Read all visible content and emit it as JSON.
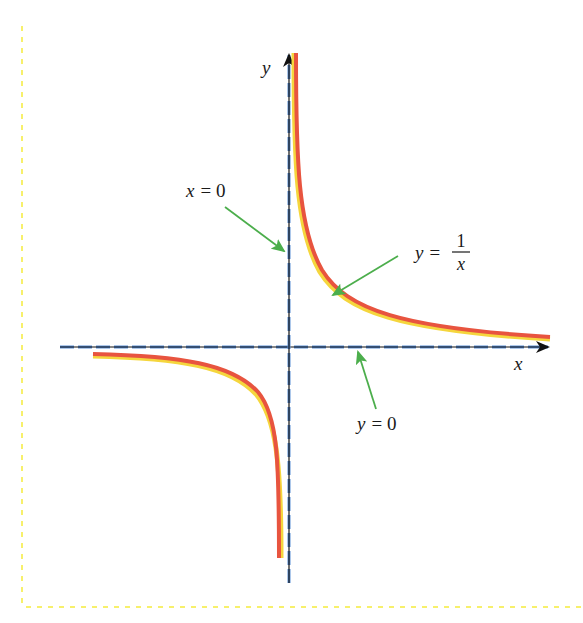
{
  "diagram": {
    "axes": {
      "x_label": "x",
      "y_label": "y"
    },
    "curve": {
      "label_lhs": "y =",
      "label_numerator": "1",
      "label_denominator": "x",
      "color": "#e8543f",
      "highlight_color": "#f5d63d"
    },
    "asymptotes": [
      {
        "label": "x = 0",
        "label_var": "x",
        "label_rest": "= 0",
        "orientation": "vertical"
      },
      {
        "label": "y = 0",
        "label_var": "y",
        "label_rest": "= 0",
        "orientation": "horizontal"
      }
    ],
    "colors": {
      "axis": "#111111",
      "asymptote_dash": "#5b8fd6",
      "arrow": "#5cb85c",
      "border": "#f7f06b"
    }
  }
}
